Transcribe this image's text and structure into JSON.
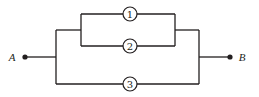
{
  "diagram": {
    "type": "series-parallel reliability network",
    "terminals": [
      {
        "id": "A",
        "label": "A"
      },
      {
        "id": "B",
        "label": "B"
      }
    ],
    "components": [
      {
        "id": "1",
        "label": "1",
        "branch": "inner-top"
      },
      {
        "id": "2",
        "label": "2",
        "branch": "inner-bottom"
      },
      {
        "id": "3",
        "label": "3",
        "branch": "outer-bottom"
      }
    ],
    "structure": "(1 parallel 2) parallel 3, between A and B",
    "colors": {
      "line": "#231f20",
      "background": "#ffffff"
    }
  }
}
